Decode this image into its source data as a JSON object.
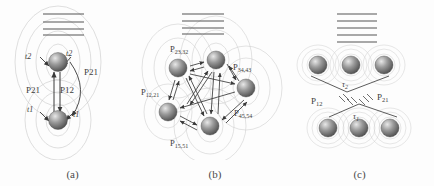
{
  "figure": {
    "panels": [
      {
        "id": "a",
        "caption": "(a)",
        "kind": "two-level-pair",
        "energy_levels": 4,
        "nodes": [
          {
            "name": "upper-ion",
            "label": ""
          },
          {
            "name": "lower-ion",
            "label": ""
          }
        ],
        "labels": {
          "upper_left_rate": "t2",
          "upper_right_rate": "t2",
          "lower_left_rate": "t1",
          "lower_right_rate": "t1",
          "left_transfer": "P21",
          "right_transfer": "P12",
          "curved_transfer": "P21"
        },
        "subscripts": {
          "upper_left_rate": "2",
          "upper_right_rate": "2",
          "lower_left_rate": "1",
          "lower_right_rate": "1",
          "left_transfer": "21",
          "right_transfer": "12",
          "curved_transfer": "21"
        }
      },
      {
        "id": "b",
        "caption": "(b)",
        "kind": "five-node-network",
        "energy_levels": 4,
        "nodes": [
          {
            "name": "node-top-left",
            "label": ""
          },
          {
            "name": "node-top-right",
            "label": ""
          },
          {
            "name": "node-right",
            "label": ""
          },
          {
            "name": "node-bottom",
            "label": ""
          },
          {
            "name": "node-bottom-left",
            "label": ""
          }
        ],
        "labels": {
          "top_rate": "P23,32",
          "right_rate": "P34,43",
          "left_rate": "P12,21",
          "lower_right_rate": "P45,54",
          "bottom_rate": "P15,51"
        },
        "label_bases": {
          "top_rate": "P",
          "right_rate": "P",
          "left_rate": "P",
          "lower_right_rate": "P",
          "bottom_rate": "P"
        },
        "label_subs": {
          "top_rate": "23,32",
          "right_rate": "34,43",
          "left_rate": "12,21",
          "lower_right_rate": "45,54",
          "bottom_rate": "15,51"
        }
      },
      {
        "id": "c",
        "caption": "(c)",
        "kind": "cluster-pair",
        "energy_levels": 5,
        "upper_cluster_count": 3,
        "lower_cluster_count": 3,
        "labels": {
          "upper_tau": "τ2",
          "lower_tau": "τ1",
          "left_transfer": "P12",
          "right_transfer": "P21"
        },
        "label_bases": {
          "upper_tau": "τ",
          "lower_tau": "τ",
          "left_transfer": "P",
          "right_transfer": "P"
        },
        "label_subs": {
          "upper_tau": "2",
          "lower_tau": "1",
          "left_transfer": "12",
          "right_transfer": "21"
        }
      }
    ]
  },
  "style": {
    "sphere_light": "#b9b9b9",
    "sphere_dark": "#4d4d4d",
    "sphere_highlight": "#e8e8e8",
    "ring_color": "#c9c9c9",
    "arrow_color": "#3a3a3a",
    "level_color": "#555555",
    "text_color": "#3c3c3c",
    "background": "#fdfdfd"
  }
}
